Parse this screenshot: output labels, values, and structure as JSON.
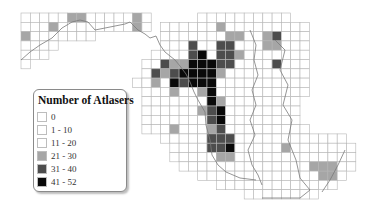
{
  "legend": {
    "title": "Number of Atlasers",
    "items": [
      {
        "label": "0",
        "color": "#ffffff"
      },
      {
        "label": "1 - 10",
        "color": "#ffffff"
      },
      {
        "label": "11 - 20",
        "color": "#ffffff"
      },
      {
        "label": "21 - 30",
        "color": "#a6a6a6"
      },
      {
        "label": "31 - 40",
        "color": "#4d4d4d"
      },
      {
        "label": "41 - 52",
        "color": "#0a0a0a"
      }
    ]
  },
  "map": {
    "grid_origin": [
      21,
      13
    ],
    "cell_size": 9.3,
    "grid_line_color": "#b5b5b5",
    "outline_color": "#7a7a7a",
    "classes": {
      "w": "#ffffff",
      "g": "#a6a6a6",
      "d": "#4d4d4d",
      "k": "#0a0a0a"
    },
    "shaded_cells": [
      [
        5,
        0,
        "g"
      ],
      [
        6,
        0,
        "g"
      ],
      [
        3,
        1,
        "g"
      ],
      [
        0,
        2,
        "g"
      ],
      [
        12,
        0,
        "g"
      ],
      [
        12,
        1,
        "g"
      ],
      [
        26,
        2,
        "g"
      ],
      [
        27,
        2,
        "d"
      ],
      [
        26,
        3,
        "g"
      ],
      [
        27,
        3,
        "g"
      ],
      [
        27,
        5,
        "d"
      ],
      [
        21,
        1,
        "g"
      ],
      [
        22,
        2,
        "g"
      ],
      [
        23,
        2,
        "g"
      ],
      [
        21,
        3,
        "g"
      ],
      [
        18,
        3,
        "d"
      ],
      [
        21,
        3,
        "d"
      ],
      [
        22,
        3,
        "d"
      ],
      [
        18,
        4,
        "d"
      ],
      [
        19,
        4,
        "k"
      ],
      [
        21,
        4,
        "d"
      ],
      [
        22,
        4,
        "d"
      ],
      [
        23,
        4,
        "g"
      ],
      [
        15,
        5,
        "d"
      ],
      [
        16,
        5,
        "g"
      ],
      [
        17,
        5,
        "g"
      ],
      [
        18,
        5,
        "k"
      ],
      [
        19,
        5,
        "k"
      ],
      [
        20,
        5,
        "k"
      ],
      [
        21,
        5,
        "d"
      ],
      [
        22,
        5,
        "d"
      ],
      [
        14,
        6,
        "d"
      ],
      [
        15,
        6,
        "g"
      ],
      [
        16,
        6,
        "d"
      ],
      [
        17,
        6,
        "k"
      ],
      [
        18,
        6,
        "k"
      ],
      [
        19,
        6,
        "k"
      ],
      [
        20,
        6,
        "k"
      ],
      [
        21,
        6,
        "g"
      ],
      [
        14,
        7,
        "g"
      ],
      [
        16,
        7,
        "k"
      ],
      [
        17,
        7,
        "d"
      ],
      [
        18,
        7,
        "k"
      ],
      [
        19,
        7,
        "k"
      ],
      [
        20,
        7,
        "k"
      ],
      [
        16,
        8,
        "g"
      ],
      [
        19,
        8,
        "g"
      ],
      [
        20,
        8,
        "k"
      ],
      [
        20,
        9,
        "k"
      ],
      [
        21,
        9,
        "g"
      ],
      [
        19,
        10,
        "g"
      ],
      [
        20,
        10,
        "d"
      ],
      [
        21,
        10,
        "k"
      ],
      [
        20,
        11,
        "d"
      ],
      [
        21,
        11,
        "k"
      ],
      [
        20,
        12,
        "g"
      ],
      [
        21,
        12,
        "d"
      ],
      [
        20,
        13,
        "d"
      ],
      [
        21,
        13,
        "d"
      ],
      [
        22,
        13,
        "d"
      ],
      [
        20,
        14,
        "d"
      ],
      [
        21,
        14,
        "d"
      ],
      [
        22,
        14,
        "k"
      ],
      [
        21,
        15,
        "g"
      ],
      [
        22,
        15,
        "g"
      ],
      [
        16,
        12,
        "g"
      ],
      [
        28,
        14,
        "g"
      ],
      [
        31,
        16,
        "g"
      ],
      [
        32,
        16,
        "g"
      ],
      [
        33,
        16,
        "g"
      ],
      [
        32,
        17,
        "g"
      ],
      [
        33,
        17,
        "g"
      ]
    ],
    "plain_rows": [
      {
        "row": 0,
        "from": 0,
        "to": 9
      },
      {
        "row": 1,
        "from": 0,
        "to": 9
      },
      {
        "row": 2,
        "from": 0,
        "to": 7
      },
      {
        "row": 3,
        "from": 0,
        "to": 3
      },
      {
        "row": 4,
        "from": 0,
        "to": 2
      },
      {
        "row": 5,
        "from": 0,
        "to": 0
      },
      {
        "row": 0,
        "from": 10,
        "to": 13
      },
      {
        "row": 1,
        "from": 10,
        "to": 13
      },
      {
        "row": 0,
        "from": 19,
        "to": 25
      },
      {
        "row": 0,
        "from": 26,
        "to": 28
      },
      {
        "row": 1,
        "from": 15,
        "to": 30
      },
      {
        "row": 2,
        "from": 15,
        "to": 30
      },
      {
        "row": 3,
        "from": 15,
        "to": 30
      },
      {
        "row": 4,
        "from": 14,
        "to": 30
      },
      {
        "row": 5,
        "from": 13,
        "to": 30
      },
      {
        "row": 6,
        "from": 13,
        "to": 30
      },
      {
        "row": 7,
        "from": 12,
        "to": 30
      },
      {
        "row": 8,
        "from": 13,
        "to": 30
      },
      {
        "row": 9,
        "from": 13,
        "to": 29
      },
      {
        "row": 10,
        "from": 13,
        "to": 29
      },
      {
        "row": 11,
        "from": 13,
        "to": 29
      },
      {
        "row": 12,
        "from": 13,
        "to": 30
      },
      {
        "row": 13,
        "from": 15,
        "to": 34
      },
      {
        "row": 14,
        "from": 16,
        "to": 35
      },
      {
        "row": 15,
        "from": 16,
        "to": 35
      },
      {
        "row": 16,
        "from": 17,
        "to": 35
      },
      {
        "row": 17,
        "from": 19,
        "to": 34
      },
      {
        "row": 18,
        "from": 21,
        "to": 33
      },
      {
        "row": 19,
        "from": 24,
        "to": 31
      }
    ]
  }
}
